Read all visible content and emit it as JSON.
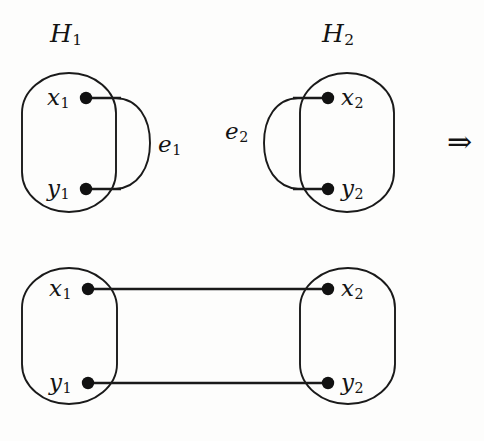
{
  "figure": {
    "type": "graph-theory-diagram",
    "background_color": "#fdfdfc",
    "ink_color": "#131313",
    "implies_symbol": "⇒",
    "top_row": {
      "graphs": [
        {
          "name": "H1",
          "title": "H",
          "title_sub": "1",
          "vertices": [
            {
              "label": "x",
              "sub": "1",
              "cx": 86,
              "cy": 98
            },
            {
              "label": "y",
              "sub": "1",
              "cx": 86,
              "cy": 189
            }
          ],
          "edge": {
            "label": "e",
            "sub": "1",
            "side": "right"
          },
          "box": {
            "x": 22,
            "y": 73,
            "width": 94,
            "height": 139
          }
        },
        {
          "name": "H2",
          "title": "H",
          "title_sub": "2",
          "vertices": [
            {
              "label": "x",
              "sub": "2",
              "cx": 328,
              "cy": 98
            },
            {
              "label": "y",
              "sub": "2",
              "cx": 328,
              "cy": 189
            }
          ],
          "edge": {
            "label": "e",
            "sub": "2",
            "side": "left"
          },
          "box": {
            "x": 300,
            "y": 73,
            "width": 94,
            "height": 139
          }
        }
      ]
    },
    "bottom_row": {
      "graphs": [
        {
          "name": "H1-merged",
          "vertices": [
            {
              "label": "x",
              "sub": "1",
              "cx": 88,
              "cy": 289
            },
            {
              "label": "y",
              "sub": "1",
              "cx": 88,
              "cy": 383
            }
          ],
          "box": {
            "x": 22,
            "y": 268,
            "width": 95,
            "height": 136
          }
        },
        {
          "name": "H2-merged",
          "vertices": [
            {
              "label": "x",
              "sub": "2",
              "cx": 328,
              "cy": 289
            },
            {
              "label": "y",
              "sub": "2",
              "cx": 328,
              "cy": 383
            }
          ],
          "box": {
            "x": 300,
            "y": 268,
            "width": 95,
            "height": 136
          }
        }
      ],
      "connecting_edges": [
        {
          "from": "x1",
          "to": "x2",
          "y": 289
        },
        {
          "from": "y1",
          "to": "y2",
          "y": 383
        }
      ]
    }
  },
  "labels": {
    "h1_title": "H",
    "h1_title_sub": "1",
    "h2_title": "H",
    "h2_title_sub": "2",
    "e1": "e",
    "e1_sub": "1",
    "e2": "e",
    "e2_sub": "2",
    "x1_top": "x",
    "x1_top_sub": "1",
    "y1_top": "y",
    "y1_top_sub": "1",
    "x2_top": "x",
    "x2_top_sub": "2",
    "y2_top": "y",
    "y2_top_sub": "2",
    "x1_bottom": "x",
    "x1_bottom_sub": "1",
    "y1_bottom": "y",
    "y1_bottom_sub": "1",
    "x2_bottom": "x",
    "x2_bottom_sub": "2",
    "y2_bottom": "y",
    "y2_bottom_sub": "2",
    "implies": "⇒"
  }
}
